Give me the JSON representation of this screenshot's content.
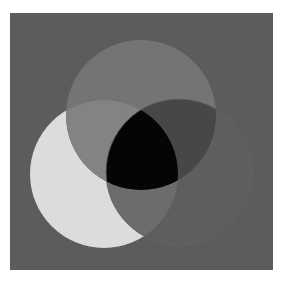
{
  "page": {
    "background": "#ffffff"
  },
  "diagram": {
    "type": "three-circle-venn",
    "frame": {
      "x": 10,
      "y": 13,
      "width": 263,
      "height": 257,
      "fill": "#5c5c5c"
    },
    "circles": {
      "top": {
        "cx": 141,
        "cy": 115,
        "r": 75
      },
      "left": {
        "cx": 104,
        "cy": 174,
        "r": 74
      },
      "right": {
        "cx": 179,
        "cy": 172,
        "r": 73
      }
    },
    "region_colors": {
      "top_only": "#747474",
      "left_only": "#dcdcdc",
      "right_only": "#5e5e5e",
      "top_left": "#838383",
      "top_right": "#474747",
      "left_right": "#6c6c6c",
      "all_three": "#050505"
    },
    "outline_color": "#646464"
  }
}
